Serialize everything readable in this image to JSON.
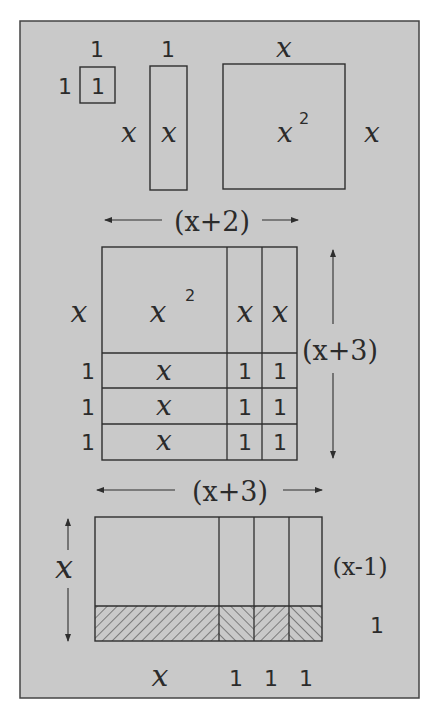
{
  "figure": {
    "background_color": "#c9c9c9",
    "line_color": "#2e2e2e",
    "text_color": "#2b2b2b"
  },
  "tiles": {
    "unit_square": {
      "top_label": "1",
      "left_label": "1",
      "inner_label": "1"
    },
    "x_strip": {
      "top_label": "1",
      "left_label": "x",
      "inner_label": "x"
    },
    "x_square": {
      "top_label": "x",
      "right_label": "x",
      "inner_label": "x",
      "inner_exponent": "2"
    }
  },
  "product_x2_x3": {
    "width_label": "(x+2)",
    "height_label": "(x+3)",
    "row_labels": [
      "x",
      "1",
      "1",
      "1"
    ],
    "cells": [
      [
        "x²",
        "x",
        "x"
      ],
      [
        "x",
        "1",
        "1"
      ],
      [
        "x",
        "1",
        "1"
      ],
      [
        "x",
        "1",
        "1"
      ]
    ],
    "top_left_cell": {
      "base": "x",
      "exponent": "2"
    }
  },
  "product_x3_x1": {
    "width_label": "(x+3)",
    "height_label": "x",
    "right_labels": {
      "upper": "(x-1)",
      "lower": "1"
    },
    "bottom_labels": [
      "x",
      "1",
      "1",
      "1"
    ]
  }
}
